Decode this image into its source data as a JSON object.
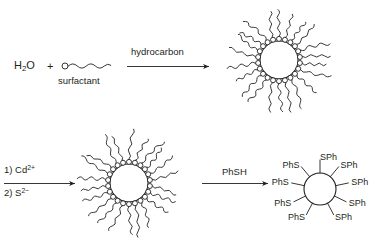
{
  "figure": {
    "type": "reaction-scheme",
    "background_color": "#ffffff",
    "ink_color": "#231f20"
  },
  "row1": {
    "reactants": {
      "water_label_main": "H",
      "water_label_sub": "2",
      "water_label_tail": "O",
      "plus": "+",
      "surfactant_label": "surfactant"
    },
    "arrow": {
      "label": "hydrocarbon"
    },
    "product": {
      "core_label_main": "H",
      "core_label_sub": "2",
      "core_label_tail": "O",
      "head_group_count": 22,
      "tail_count": 22
    }
  },
  "row2": {
    "arrow": {
      "label_top": "1) Cd",
      "label_top_sup": "2+",
      "label_bottom": "2) S",
      "label_bottom_sup": "2−"
    },
    "intermediate": {
      "core_label": "CdS",
      "head_group_count": 22,
      "tail_count": 22
    },
    "arrow2": {
      "label": "PhSH"
    },
    "product": {
      "core_label": "CdS",
      "ligands": [
        {
          "text": "SPh",
          "angle": -90
        },
        {
          "text": "SPh",
          "angle": -50
        },
        {
          "text": "SPh",
          "angle": -12
        },
        {
          "text": "SPh",
          "angle": 26
        },
        {
          "text": "SPh",
          "angle": 62
        },
        {
          "text": "PhS",
          "angle": 118
        },
        {
          "text": "PhS",
          "angle": 154
        },
        {
          "text": "PhS",
          "angle": 192
        },
        {
          "text": "PhS",
          "angle": 230
        }
      ]
    }
  }
}
